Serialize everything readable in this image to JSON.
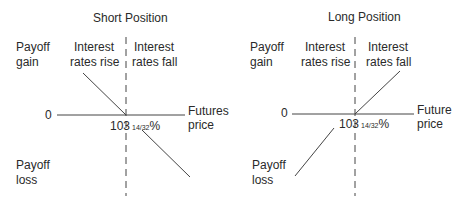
{
  "left": {
    "title": "Short Position",
    "y_gain": [
      "Payoff",
      "gain"
    ],
    "y_loss": [
      "Payoff",
      "loss"
    ],
    "zero": "0",
    "region_left": [
      "Interest",
      "rates rise"
    ],
    "region_right": [
      "Interest",
      "rates fall"
    ],
    "x_axis": [
      "Futures",
      "price"
    ],
    "strike_main": "103",
    "strike_frac": "14/32",
    "strike_pct": "%"
  },
  "right": {
    "title": "Long Position",
    "y_gain": [
      "Payoff",
      "gain"
    ],
    "y_loss": [
      "Payoff",
      "loss"
    ],
    "zero": "0",
    "region_left": [
      "Interest",
      "rates rise"
    ],
    "region_right": [
      "Interest",
      "rates fall"
    ],
    "x_axis": [
      "Future",
      "price"
    ],
    "strike_main": "103",
    "strike_frac": "14/32",
    "strike_pct": "%"
  },
  "colors": {
    "line": "#3a3a3a",
    "text": "#2a2a2a"
  }
}
